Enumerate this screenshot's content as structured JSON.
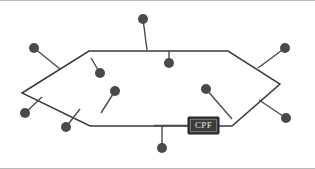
{
  "figure": {
    "type": "network-topology-diagram",
    "title": "",
    "background_color": "#ffffff",
    "frame": {
      "border_color": "#b8b8b8",
      "top_border": true,
      "bottom_border": true
    }
  },
  "palette": {
    "ring_edge_color": "#3a3a3a",
    "stem_color": "#4a4a4a",
    "node_fill": "#4a4a4a",
    "box_fill": "#3c3c3c",
    "box_border": "#1a1a1a",
    "box_text_color": "#e8e8e8"
  },
  "ring": {
    "name": "hexagonal-ring-backbone",
    "closed": true,
    "vertices": [
      {
        "id": "v-left",
        "x": 22,
        "y": 92
      },
      {
        "id": "v-top-left",
        "x": 89,
        "y": 50
      },
      {
        "id": "v-top-right",
        "x": 228,
        "y": 50
      },
      {
        "id": "v-right",
        "x": 280,
        "y": 83
      },
      {
        "id": "v-bottom-right",
        "x": 232,
        "y": 125
      },
      {
        "id": "v-bottom-left",
        "x": 90,
        "y": 125
      }
    ]
  },
  "nodes": [
    {
      "id": "node-top-left-outer",
      "label": "",
      "x": 34,
      "y": 47,
      "r": 5.0,
      "attach_x": 60,
      "attach_y": 68
    },
    {
      "id": "node-top-center-outer",
      "label": "",
      "x": 143,
      "y": 18,
      "r": 5.0,
      "attach_x": 147,
      "attach_y": 49
    },
    {
      "id": "node-top-right-outer",
      "label": "",
      "x": 285,
      "y": 47,
      "r": 5.0,
      "attach_x": 258,
      "attach_y": 67
    },
    {
      "id": "node-inner-upper-left",
      "label": "",
      "x": 100,
      "y": 72,
      "r": 5.0,
      "attach_x": 91,
      "attach_y": 57
    },
    {
      "id": "node-inner-top-center",
      "label": "",
      "x": 169,
      "y": 62,
      "r": 5.0,
      "attach_x": 169,
      "attach_y": 50
    },
    {
      "id": "node-inner-lower-left",
      "label": "",
      "x": 115,
      "y": 90,
      "r": 5.0,
      "attach_x": 101,
      "attach_y": 112
    },
    {
      "id": "node-inner-right",
      "label": "",
      "x": 206,
      "y": 88,
      "r": 5.0,
      "attach_x": 232,
      "attach_y": 118
    },
    {
      "id": "node-bottom-left-outer",
      "label": "",
      "x": 25,
      "y": 112,
      "r": 5.0,
      "attach_x": 42,
      "attach_y": 96
    },
    {
      "id": "node-bottom-mid-outer",
      "label": "",
      "x": 66,
      "y": 126,
      "r": 5.0,
      "attach_x": 80,
      "attach_y": 108
    },
    {
      "id": "node-bottom-center-outer",
      "label": "",
      "x": 162,
      "y": 147,
      "r": 5.0,
      "attach_x": 162,
      "attach_y": 124
    },
    {
      "id": "node-bottom-right-outer",
      "label": "",
      "x": 286,
      "y": 117,
      "r": 5.0,
      "attach_x": 259,
      "attach_y": 99
    }
  ],
  "labeled_box": {
    "id": "cpf-box",
    "label": "CPF",
    "x": 188,
    "y": 116,
    "width": 31,
    "height": 17,
    "connector": {
      "from_x": 154,
      "from_y": 124.5,
      "to_x": 188,
      "to_y": 124.5
    }
  }
}
